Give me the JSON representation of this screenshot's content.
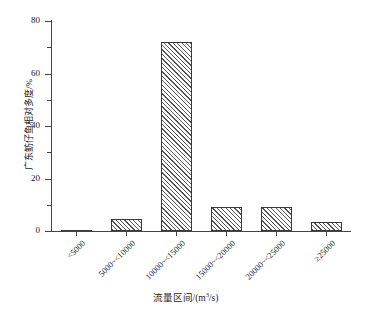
{
  "chart_data": {
    "type": "bar",
    "title": "",
    "subtitle": "",
    "xlabel": "流量区间/(m³/s)",
    "ylabel": "广东鲂仔鱼相对多度/%",
    "categories": [
      "<5000",
      "5000~<10000",
      "10000~<15000",
      "15000~<20000",
      "20000~<25000",
      "≥25000"
    ],
    "values": [
      0.2,
      4.5,
      72.0,
      9.0,
      9.0,
      3.5
    ],
    "ylim": [
      0,
      80
    ],
    "xlim_note": "6 categorical bins",
    "y_major_ticks": [
      0,
      20,
      40,
      60,
      80
    ],
    "y_minor_ticks": [
      10,
      30,
      50,
      70
    ],
    "y_tick_labels": [
      "0",
      "20",
      "40",
      "60",
      "80"
    ],
    "grid": false,
    "legend": false,
    "legend_position": "none",
    "bar_fill": "#ffffff",
    "bar_hatch": "diagonal-lines",
    "bar_edge_color": "#3a3a3a",
    "axis_color": "#444444",
    "background": "#ffffff",
    "x_label_rotation_deg": -45
  },
  "axis_title_units": {
    "x_prefix": "流量区间/(m",
    "x_sup": "3",
    "x_suffix": "/s)"
  }
}
